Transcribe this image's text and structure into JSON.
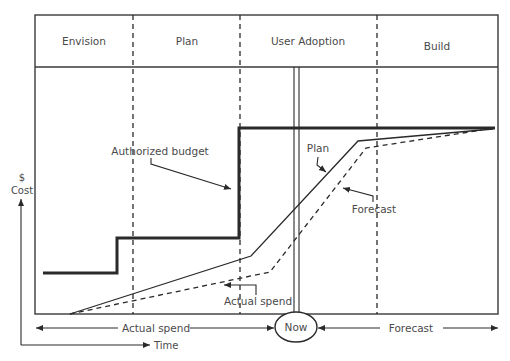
{
  "diagram": {
    "phases": [
      {
        "label": "Envision"
      },
      {
        "label": "Plan"
      },
      {
        "label": "User Adoption"
      },
      {
        "label": "Build"
      }
    ],
    "annotations": {
      "authorized_budget": "Authorized budget",
      "plan": "Plan",
      "forecast": "Forecast",
      "actual_spend_inner": "Actual spend"
    },
    "axes": {
      "y_symbol": "$",
      "y_label": "Cost",
      "x_label": "Time"
    },
    "timeline": {
      "left_label": "Actual spend",
      "now_label": "Now",
      "right_label": "Forecast"
    },
    "series": [
      {
        "name": "Authorized budget",
        "style": "thick-solid",
        "points": [
          [
            43,
            273
          ],
          [
            117,
            273
          ],
          [
            117,
            238
          ],
          [
            239,
            238
          ],
          [
            239,
            128
          ],
          [
            495,
            128
          ]
        ]
      },
      {
        "name": "Plan",
        "style": "solid",
        "points": [
          [
            70,
            314
          ],
          [
            251,
            256
          ],
          [
            358,
            141
          ],
          [
            493,
            129
          ]
        ]
      },
      {
        "name": "Forecast",
        "style": "dashed",
        "points": [
          [
            70,
            314
          ],
          [
            270,
            272
          ],
          [
            366,
            148
          ],
          [
            482,
            130
          ]
        ]
      }
    ],
    "colors": {
      "line": "#2a2a2a",
      "text": "#4a4a4a",
      "background": "#ffffff"
    }
  }
}
